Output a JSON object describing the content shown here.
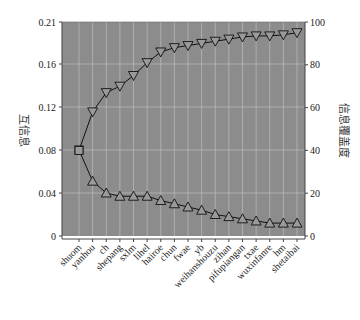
{
  "chart_data": {
    "type": "line",
    "title": "",
    "xlabel": "",
    "ylabel_left": "互信息",
    "ylabel_right": "信息覆盖度",
    "categories": [
      "shuom",
      "yanhou",
      "ch",
      "shepang",
      "sxlm",
      "lihel",
      "hairoe",
      "chun",
      "fwae",
      "yb",
      "weihanshouzu",
      "zihan",
      "pifupiangan",
      "txae",
      "wuxinfanre",
      "hm",
      "shetaibai"
    ],
    "left_axis": {
      "ticks": [
        0,
        0.04,
        0.08,
        0.12,
        0.16,
        0.21
      ],
      "tick_labels": [
        "0",
        "0.04",
        "0.08",
        "0.12",
        "0.16",
        "0.21"
      ],
      "ylim": [
        0,
        0.21
      ]
    },
    "right_axis": {
      "ticks": [
        0,
        20,
        40,
        60,
        80,
        100
      ],
      "tick_labels": [
        "0",
        "20",
        "40",
        "60",
        "80",
        "100"
      ],
      "ylim": [
        0,
        100
      ]
    },
    "series": [
      {
        "name": "互信息",
        "axis": "left",
        "marker": "triangle-up",
        "values": [
          0.08,
          0.051,
          0.04,
          0.037,
          0.037,
          0.037,
          0.033,
          0.03,
          0.027,
          0.024,
          0.02,
          0.018,
          0.016,
          0.014,
          0.012,
          0.012,
          0.012
        ]
      },
      {
        "name": "信息覆盖度",
        "axis": "right",
        "marker": "triangle-down",
        "values": [
          40,
          58,
          67,
          70,
          75,
          81,
          86,
          88,
          89,
          90,
          91,
          92,
          93,
          93.5,
          93.5,
          94,
          95
        ]
      }
    ],
    "grid": true,
    "legend": "none",
    "colors": {
      "plot_bg": "#8c8c8c",
      "grid": "#b8b8b8",
      "line": "#111111",
      "marker_fill": "#9a9a9a"
    }
  }
}
